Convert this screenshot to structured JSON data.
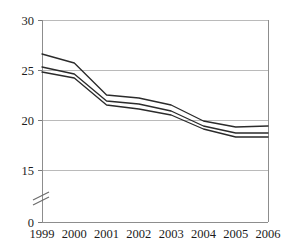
{
  "chart_data": {
    "type": "line",
    "title": "",
    "subtitle": "",
    "xlabel": "",
    "ylabel": "",
    "categories": [
      "1999",
      "2000",
      "2001",
      "2002",
      "2003",
      "2004",
      "2005",
      "2006"
    ],
    "x": [
      1999,
      2000,
      2001,
      2002,
      2003,
      2004,
      2005,
      2006
    ],
    "series": [
      {
        "name": "upper-bound",
        "values": [
          26.6,
          25.7,
          22.5,
          22.2,
          21.5,
          19.9,
          19.3,
          19.4
        ]
      },
      {
        "name": "estimate",
        "values": [
          25.3,
          24.6,
          21.9,
          21.6,
          20.9,
          19.4,
          18.7,
          18.7
        ]
      },
      {
        "name": "lower-bound",
        "values": [
          24.8,
          24.2,
          21.5,
          21.1,
          20.5,
          19.1,
          18.3,
          18.3
        ]
      }
    ],
    "ylim": [
      0,
      30
    ],
    "y_ticks": [
      0,
      15,
      20,
      25,
      30
    ],
    "y_tick_labels": [
      "0",
      "15",
      "20",
      "25",
      "30"
    ],
    "y_axis_break": true,
    "y_axis_break_between": [
      0,
      15
    ],
    "grid": {
      "horizontal": true,
      "vertical": false
    },
    "legend": {
      "visible": false,
      "position": "none",
      "entries": []
    },
    "annotations": [],
    "colors": {
      "line": "#2b2b2b",
      "gridline": "#a9a9a9",
      "axis": "#8d8d8d",
      "background": "#ffffff",
      "text": "#1c1c1c"
    }
  }
}
